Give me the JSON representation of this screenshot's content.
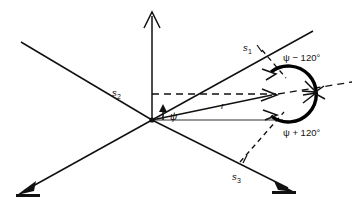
{
  "figure": {
    "type": "vector-phasor-diagram",
    "background_color": "#ffffff",
    "line_color": "#111111"
  },
  "axes": [
    {
      "id": "s1",
      "label": "s",
      "subscript": "1",
      "label_x": 243,
      "label_y": 43,
      "tick": true
    },
    {
      "id": "s2",
      "label": "s",
      "subscript": "2",
      "label_x": 112,
      "label_y": 88,
      "tick": false
    },
    {
      "id": "s3",
      "label": "s",
      "subscript": "3",
      "label_x": 232,
      "label_y": 172,
      "tick": true
    }
  ],
  "vector": {
    "label": "r",
    "label_x": 221,
    "label_y": 101
  },
  "angles": {
    "psi": {
      "label": "ψ",
      "label_x": 170,
      "label_y": 112
    },
    "psi_minus": {
      "label": "ψ − 120°",
      "label_x": 283,
      "label_y": 53
    },
    "psi_plus": {
      "label": "ψ + 120°",
      "label_x": 283,
      "label_y": 128
    }
  },
  "geometry": {
    "origin_x": 152,
    "origin_y": 120,
    "vertical_axis_top_y": 12,
    "vector_tip_x": 278,
    "vector_tip_y": 96,
    "arc_center_x": 290,
    "arc_center_y": 94,
    "arc_radius": 28
  }
}
